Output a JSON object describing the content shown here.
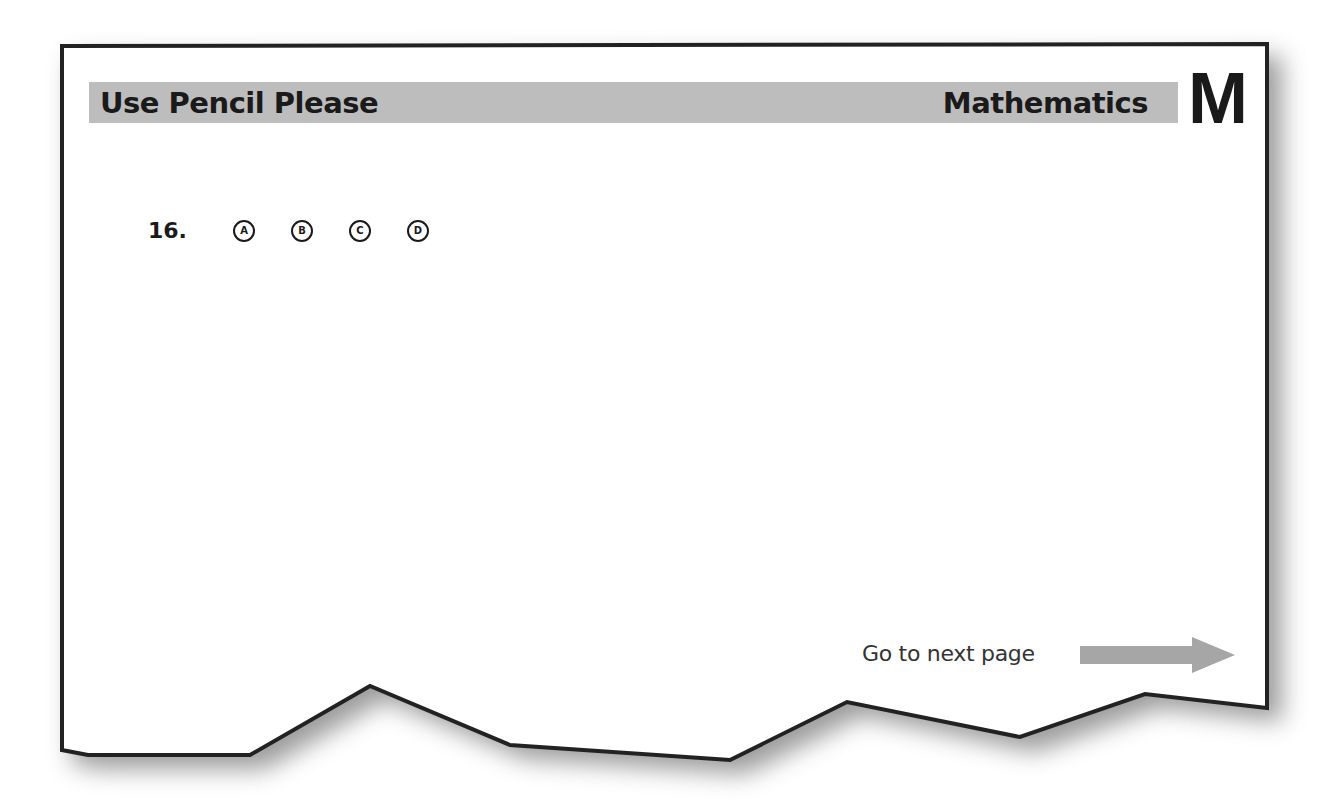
{
  "header": {
    "left_label": "Use Pencil Please",
    "right_label": "Mathematics",
    "subject_letter": "M",
    "bar_color": "#bdbdbd"
  },
  "question": {
    "number": "16.",
    "options": [
      "A",
      "B",
      "C",
      "D"
    ]
  },
  "footer": {
    "next_label": "Go to next page",
    "arrow_icon": "right-arrow-icon",
    "arrow_color": "#a6a6a6"
  }
}
